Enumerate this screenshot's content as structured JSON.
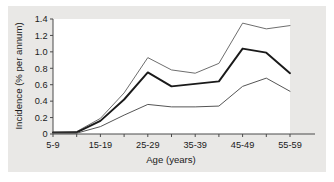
{
  "chart_data": {
    "type": "line",
    "title": "",
    "xlabel": "Age (years)",
    "ylabel": "Incidence (% per annum)",
    "ylim": [
      0,
      1.4
    ],
    "ytick_labels": [
      "0",
      "0.2",
      "0.4",
      "0.6",
      "0.8",
      "1.0",
      "1.2",
      "1.4"
    ],
    "ytick_values": [
      0,
      0.2,
      0.4,
      0.6,
      0.8,
      1.0,
      1.2,
      1.4
    ],
    "grid": false,
    "legend": "none",
    "categories": [
      "5-9",
      "10-14",
      "15-19",
      "20-24",
      "25-29",
      "30-34",
      "35-39",
      "40-44",
      "45-49",
      "50-54",
      "55-59"
    ],
    "xtick_labels": [
      "5-9",
      "15-19",
      "25-29",
      "35-39",
      "45-49",
      "55-59"
    ],
    "xtick_label_indices": [
      0,
      2,
      4,
      6,
      8,
      10
    ],
    "series": [
      {
        "name": "upper-limit",
        "color": "#6e6e6e",
        "width": 1.0,
        "values": [
          0.02,
          0.03,
          0.19,
          0.5,
          0.93,
          0.78,
          0.74,
          0.86,
          1.35,
          1.28,
          1.32
        ]
      },
      {
        "name": "central-estimate",
        "color": "#1a1a1a",
        "width": 1.9,
        "values": [
          0.02,
          0.02,
          0.16,
          0.42,
          0.75,
          0.58,
          0.61,
          0.64,
          1.04,
          0.99,
          0.74
        ]
      },
      {
        "name": "lower-limit",
        "color": "#555555",
        "width": 1.0,
        "values": [
          0.01,
          0.01,
          0.09,
          0.23,
          0.36,
          0.33,
          0.33,
          0.34,
          0.58,
          0.68,
          0.52
        ]
      }
    ]
  },
  "figure": {
    "background_color": "#e9e8e6",
    "plot_background_color": "#ffffff",
    "axis_color": "#4a4a4a"
  }
}
